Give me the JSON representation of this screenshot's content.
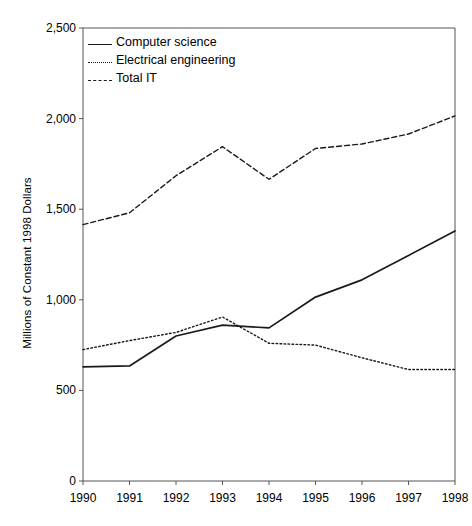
{
  "chart_data": {
    "type": "line",
    "title": "",
    "xlabel": "",
    "ylabel": "Millions of Constant 1998 Dollars",
    "categories": [
      "1990",
      "1991",
      "1992",
      "1993",
      "1994",
      "1995",
      "1996",
      "1997",
      "1998"
    ],
    "x": [
      1990,
      1991,
      1992,
      1993,
      1994,
      1995,
      1996,
      1997,
      1998
    ],
    "ylim": [
      0,
      2500
    ],
    "yticks": [
      0,
      500,
      1000,
      1500,
      2000,
      2500
    ],
    "ytick_labels": [
      "0",
      "500",
      "1,000",
      "1,500",
      "2,000",
      "2,500"
    ],
    "grid": false,
    "legend_position": "upper left (inside axes)",
    "series": [
      {
        "name": "Computer science",
        "style": "solid",
        "color": "#1a1a1a",
        "values": [
          630,
          635,
          800,
          860,
          845,
          1015,
          1110,
          1245,
          1380
        ]
      },
      {
        "name": "Electrical engineering",
        "style": "dotted",
        "color": "#1a1a1a",
        "values": [
          725,
          775,
          820,
          905,
          760,
          750,
          680,
          615,
          615
        ]
      },
      {
        "name": "Total IT",
        "style": "dashed",
        "color": "#1a1a1a",
        "values": [
          1415,
          1480,
          1685,
          1845,
          1665,
          1835,
          1860,
          1915,
          2015
        ]
      }
    ]
  },
  "axes": {
    "y_title": "Millions of Constant 1998 Dollars",
    "y_labels": [
      "2,500",
      "2,000",
      "1,500",
      "1,000",
      "500",
      "0"
    ],
    "x_labels": [
      "1990",
      "1991",
      "1992",
      "1993",
      "1994",
      "1995",
      "1996",
      "1997",
      "1998"
    ]
  },
  "legend": {
    "items": [
      {
        "label": "Computer science",
        "key": "solid-line-key"
      },
      {
        "label": "Electrical engineering",
        "key": "dotted-line-key"
      },
      {
        "label": "Total IT",
        "key": "dashed-line-key"
      }
    ]
  },
  "colors": {
    "line": "#1a1a1a",
    "axis": "#555555",
    "background": "#ffffff"
  }
}
